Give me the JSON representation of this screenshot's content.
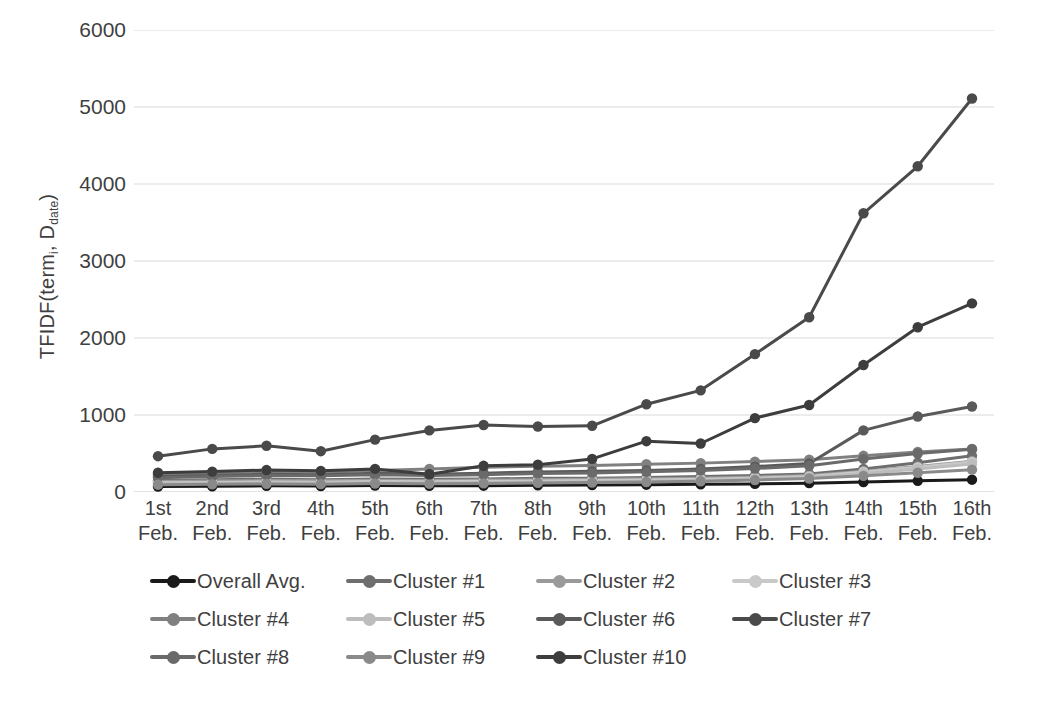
{
  "chart_data": {
    "type": "line",
    "title": "",
    "xlabel": "",
    "ylabel": "TFIDF(term_i, D_date)",
    "ylabel_parts": {
      "prefix": "TFIDF(term",
      "sub1": "i",
      "mid": ", D",
      "sub2": "date",
      "suffix": ")"
    },
    "ylim": [
      0,
      6000
    ],
    "yticks": [
      6000,
      5000,
      4000,
      3000,
      2000,
      1000,
      0
    ],
    "ytick_labels": [
      "6000",
      "5000",
      "4000",
      "3000",
      "2000",
      "1000",
      "0"
    ],
    "grid": true,
    "grid_axis": "y",
    "legend_position": "bottom",
    "legend_columns": 4,
    "categories": [
      "1st Feb.",
      "2nd Feb.",
      "3rd Feb.",
      "4th Feb.",
      "5th Feb.",
      "6th Feb.",
      "7th Feb.",
      "8th Feb.",
      "9th Feb.",
      "10th Feb.",
      "11th Feb.",
      "12th Feb.",
      "13th Feb.",
      "14th Feb.",
      "15th Feb.",
      "16th Feb."
    ],
    "category_lines": [
      [
        "1st",
        "Feb."
      ],
      [
        "2nd",
        "Feb."
      ],
      [
        "3rd",
        "Feb."
      ],
      [
        "4th",
        "Feb."
      ],
      [
        "5th",
        "Feb."
      ],
      [
        "6th",
        "Feb."
      ],
      [
        "7th",
        "Feb."
      ],
      [
        "8th",
        "Feb."
      ],
      [
        "9th",
        "Feb."
      ],
      [
        "10th",
        "Feb."
      ],
      [
        "11th",
        "Feb."
      ],
      [
        "12th",
        "Feb."
      ],
      [
        "13th",
        "Feb."
      ],
      [
        "14th",
        "Feb."
      ],
      [
        "15th",
        "Feb."
      ],
      [
        "16th",
        "Feb."
      ]
    ],
    "series": [
      {
        "name": "Overall Avg.",
        "color": "#1a1a1a",
        "values": [
          70,
          75,
          80,
          78,
          85,
          80,
          82,
          88,
          90,
          95,
          100,
          105,
          115,
          130,
          145,
          160
        ]
      },
      {
        "name": "Cluster #1",
        "color": "#6e6e6e",
        "values": [
          150,
          160,
          165,
          160,
          170,
          165,
          170,
          178,
          180,
          188,
          200,
          215,
          235,
          300,
          380,
          470
        ]
      },
      {
        "name": "Cluster #2",
        "color": "#9a9a9a",
        "values": [
          135,
          142,
          148,
          145,
          152,
          150,
          155,
          160,
          165,
          172,
          180,
          195,
          215,
          270,
          330,
          400
        ]
      },
      {
        "name": "Cluster #3",
        "color": "#c9c9c9",
        "values": [
          120,
          125,
          130,
          128,
          135,
          132,
          138,
          142,
          148,
          155,
          165,
          180,
          200,
          260,
          320,
          390
        ]
      },
      {
        "name": "Cluster #4",
        "color": "#808080",
        "values": [
          230,
          245,
          265,
          255,
          280,
          300,
          320,
          335,
          345,
          360,
          375,
          395,
          420,
          470,
          520,
          560
        ]
      },
      {
        "name": "Cluster #5",
        "color": "#bdbdbd",
        "values": [
          110,
          115,
          118,
          116,
          122,
          120,
          124,
          128,
          132,
          140,
          150,
          165,
          185,
          240,
          300,
          365
        ]
      },
      {
        "name": "Cluster #6",
        "color": "#5a5a5a",
        "values": [
          200,
          215,
          230,
          225,
          245,
          230,
          245,
          260,
          268,
          280,
          300,
          330,
          370,
          800,
          980,
          1110
        ]
      },
      {
        "name": "Cluster #7",
        "color": "#4a4a4a",
        "values": [
          465,
          560,
          600,
          530,
          680,
          800,
          870,
          850,
          860,
          1140,
          1320,
          1790,
          2270,
          3620,
          4230,
          5110
        ]
      },
      {
        "name": "Cluster #8",
        "color": "#6a6a6a",
        "values": [
          185,
          200,
          215,
          210,
          225,
          215,
          225,
          240,
          248,
          262,
          280,
          305,
          340,
          430,
          500,
          555
        ]
      },
      {
        "name": "Cluster #9",
        "color": "#8a8a8a",
        "values": [
          95,
          100,
          105,
          102,
          110,
          108,
          112,
          118,
          122,
          130,
          140,
          155,
          175,
          210,
          250,
          290
        ]
      },
      {
        "name": "Cluster #10",
        "color": "#3d3d3d",
        "values": [
          250,
          265,
          285,
          275,
          300,
          230,
          340,
          355,
          430,
          660,
          630,
          960,
          1130,
          1650,
          2140,
          2450
        ]
      }
    ]
  },
  "legend": {
    "rows": [
      [
        "Overall Avg.",
        "Cluster #1",
        "Cluster #2",
        "Cluster #3"
      ],
      [
        "Cluster #4",
        "Cluster #5",
        "Cluster #6",
        "Cluster #7"
      ],
      [
        "Cluster #8",
        "Cluster #9",
        "Cluster #10"
      ]
    ]
  },
  "colors": {
    "grid": "#d9d9d9",
    "text": "#3f3f3f",
    "background": "#ffffff"
  }
}
